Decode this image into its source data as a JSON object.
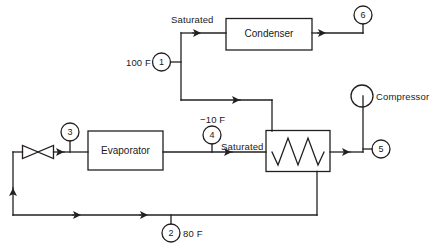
{
  "diagram": {
    "line_color": "#231f20",
    "background": "#ffffff",
    "components": [
      {
        "id": "condenser",
        "label": "Condenser",
        "shape": "rectangle"
      },
      {
        "id": "evaporator",
        "label": "Evaporator",
        "shape": "rectangle"
      },
      {
        "id": "heat-exchanger",
        "label": "",
        "shape": "rectangle-with-coil"
      },
      {
        "id": "compressor",
        "label": "Compressor",
        "shape": "circle"
      },
      {
        "id": "expansion-valve",
        "label": "",
        "shape": "bowtie"
      }
    ],
    "state_points": [
      {
        "number": "1",
        "annotation": "100 F"
      },
      {
        "number": "2",
        "annotation": "80 F"
      },
      {
        "number": "3",
        "annotation": ""
      },
      {
        "number": "4",
        "annotation": "-10 F"
      },
      {
        "number": "5",
        "annotation": ""
      },
      {
        "number": "6",
        "annotation": ""
      }
    ],
    "annotations": [
      {
        "id": "saturated-top",
        "text": "Saturated"
      },
      {
        "id": "temp-100f",
        "text": "100 F"
      },
      {
        "id": "temp-minus10f",
        "text": "−10 F"
      },
      {
        "id": "saturated-mid",
        "text": "Saturated"
      },
      {
        "id": "temp-80f",
        "text": "80 F"
      },
      {
        "id": "compressor-label",
        "text": "Compressor"
      }
    ],
    "node_labels": {
      "n1": "1",
      "n2": "2",
      "n3": "3",
      "n4": "4",
      "n5": "5",
      "n6": "6"
    }
  }
}
